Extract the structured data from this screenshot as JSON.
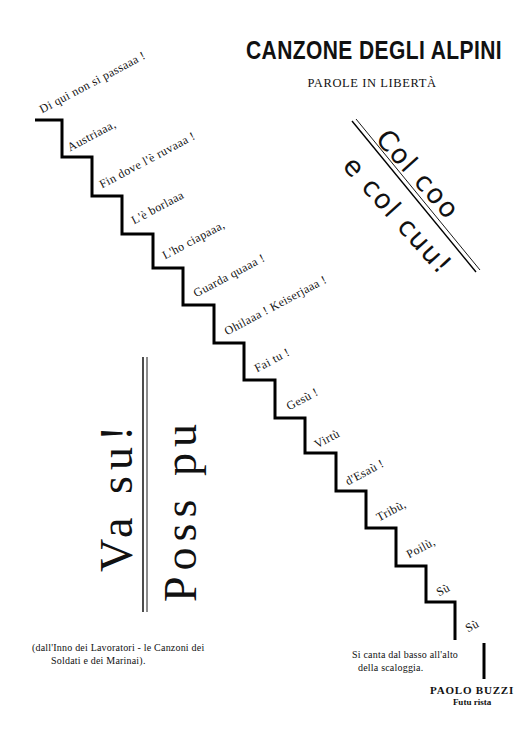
{
  "header": {
    "title": "CANZONE DEGLI ALPINI",
    "subtitle": "PAROLE IN LIBERTÀ"
  },
  "staircase": {
    "lines": [
      "Di qui non si passaaa !",
      "Austriaaa,",
      "Fin dove l'è ruvaaa !",
      "L'è borlaaa",
      "L'ho ciapaaa,",
      "Guarda quaaa !",
      "Ohilaaa ! Keiserjaaa !",
      "Fai tu !",
      "Gesù !",
      "Virtù",
      "d'Esaù !",
      "Tribù,",
      "Poilù,",
      "Sù",
      "Sù"
    ],
    "line_color": "#000000"
  },
  "diagonal_block": {
    "top": "Col coo",
    "bottom": "e col cuu!"
  },
  "vertical_block": {
    "left": "Va su!",
    "right": "Poss pu"
  },
  "footnote": {
    "line1": "(dall'Inno dei Lavoratori - le Canzoni dei",
    "line2": "Soldati e dei Marinai)."
  },
  "instruction": {
    "line1": "Si canta dal basso all'alto",
    "line2": "della scaloggia."
  },
  "signature": {
    "author": "PAOLO BUZZI",
    "movement": "Futu rista"
  }
}
